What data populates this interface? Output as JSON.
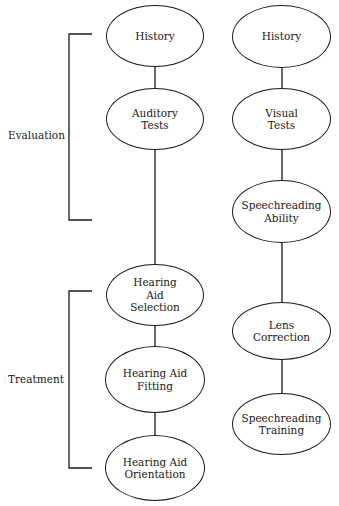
{
  "brackets": [
    {
      "id": "evaluation",
      "label": "Evaluation"
    },
    {
      "id": "treatment",
      "label": "Treatment"
    }
  ],
  "left_column": {
    "nodes": [
      {
        "label": "History"
      },
      {
        "label": "Auditory\nTests"
      },
      {
        "label": "Hearing\nAid\nSelection"
      },
      {
        "label": "Hearing Aid\nFitting"
      },
      {
        "label": "Hearing Aid\nOrientation"
      }
    ]
  },
  "right_column": {
    "nodes": [
      {
        "label": "History"
      },
      {
        "label": "Visual\nTests"
      },
      {
        "label": "Speechreading\nAbility"
      },
      {
        "label": "Lens\nCorrection"
      },
      {
        "label": "Speechreading\nTraining"
      }
    ]
  },
  "colors": {
    "stroke": "#1a1a1a",
    "background": "#ffffff"
  }
}
